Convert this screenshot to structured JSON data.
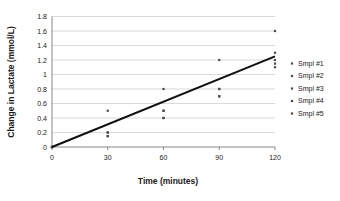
{
  "chart_data": {
    "type": "scatter",
    "title": "",
    "xlabel": "Time (minutes)",
    "ylabel": "Change in Lactate (mmol/L)",
    "xlim": [
      0,
      120
    ],
    "ylim": [
      0,
      1.8
    ],
    "xticks": [
      0,
      30,
      60,
      90,
      120
    ],
    "xtick_labels": [
      "0",
      "30",
      "60",
      "90",
      "120"
    ],
    "yticks": [
      0,
      0.2,
      0.4,
      0.6,
      0.8,
      1,
      1.2,
      1.4,
      1.6,
      1.8
    ],
    "ytick_labels": [
      "0",
      "0.2",
      "0.4",
      "0.6",
      "0.8",
      "1",
      "1.2",
      "1.4",
      "1.6",
      "1.8"
    ],
    "grid": "horizontal",
    "legend_position": "right",
    "series": [
      {
        "name": "Smpl #1",
        "marker": "dot",
        "x": [
          0,
          30,
          60,
          90,
          120
        ],
        "y": [
          0.0,
          0.5,
          0.8,
          1.2,
          1.6
        ]
      },
      {
        "name": "Smpl #2",
        "marker": "dot",
        "x": [
          0,
          30,
          60,
          90,
          120
        ],
        "y": [
          0.0,
          0.2,
          0.5,
          0.8,
          1.3
        ]
      },
      {
        "name": "Smpl #3",
        "marker": "dot",
        "x": [
          0,
          30,
          60,
          90,
          120
        ],
        "y": [
          0.0,
          0.2,
          0.5,
          0.8,
          1.2
        ]
      },
      {
        "name": "Smpl #4",
        "marker": "dot",
        "x": [
          0,
          30,
          60,
          90,
          120
        ],
        "y": [
          0.0,
          0.15,
          0.4,
          0.7,
          1.15
        ]
      },
      {
        "name": "Smpl #5",
        "marker": "dot",
        "x": [
          0,
          30,
          60,
          90,
          120
        ],
        "y": [
          0.0,
          0.15,
          0.4,
          0.7,
          1.1
        ]
      }
    ],
    "trendline": {
      "x": [
        0,
        120
      ],
      "y": [
        0.0,
        1.25
      ]
    },
    "colors": {
      "marker": "#4a4a4a",
      "trendline": "#111111",
      "grid": "#c9c9c9",
      "axis": "#7a7a7a",
      "text": "#1a1a1a"
    }
  }
}
